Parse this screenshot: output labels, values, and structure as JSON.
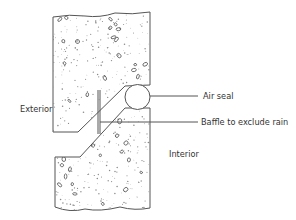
{
  "diagram": {
    "labels": {
      "exterior": "Exterior",
      "interior": "Interior",
      "air_seal": "Air seal",
      "baffle": "Baffle to exclude rain"
    },
    "components": [
      {
        "id": "upper-panel",
        "type": "concrete-block"
      },
      {
        "id": "lower-panel",
        "type": "concrete-block"
      },
      {
        "id": "air-seal",
        "type": "circular-gasket"
      },
      {
        "id": "baffle",
        "type": "vertical-strip"
      }
    ],
    "colors": {
      "line": "#555555",
      "text": "#333333",
      "background": "#ffffff"
    }
  }
}
